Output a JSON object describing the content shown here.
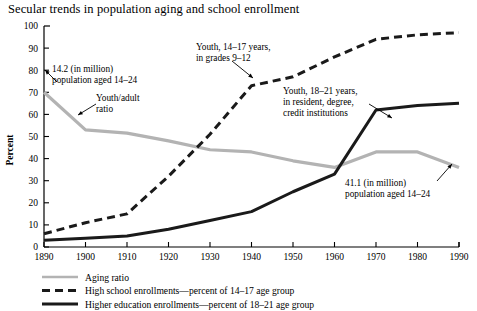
{
  "chart_data": {
    "type": "line",
    "title": "Secular trends in population aging and school enrollment",
    "xlabel": "",
    "ylabel": "Percent",
    "xlim": [
      1890,
      1990
    ],
    "ylim": [
      0,
      100
    ],
    "grid": false,
    "legend_position": "below-plot-left",
    "x": [
      1890,
      1900,
      1910,
      1920,
      1930,
      1940,
      1950,
      1960,
      1970,
      1980,
      1990
    ],
    "xticklabels": [
      "1890",
      "1900",
      "1910",
      "1920",
      "1930",
      "1940",
      "1950",
      "1960",
      "1970",
      "1980",
      "1990"
    ],
    "yticklabels": [
      "0",
      "10",
      "20",
      "30",
      "40",
      "50",
      "60",
      "70",
      "80",
      "90",
      "100"
    ],
    "yticks": [
      0,
      10,
      20,
      30,
      40,
      50,
      60,
      70,
      80,
      90,
      100
    ],
    "series": [
      {
        "name": "Aging ratio",
        "key": "aging_ratio",
        "style": "solid",
        "color": "#b3b3b3",
        "width": 3.2,
        "values": [
          70,
          53,
          51.5,
          48,
          44,
          43,
          39,
          36,
          43,
          43,
          36
        ]
      },
      {
        "name": "High school enrollments—percent of 14–17 age group",
        "key": "high_school",
        "style": "dashed",
        "color": "#1a1a1a",
        "width": 3.0,
        "values": [
          6,
          11,
          15,
          32,
          51,
          73,
          77,
          86,
          94,
          96,
          97
        ]
      },
      {
        "name": "Higher education enrollments—percent of 18–21 age group",
        "key": "higher_education",
        "style": "solid",
        "color": "#1a1a1a",
        "width": 3.0,
        "values": [
          3,
          4,
          5,
          8,
          12,
          16,
          25,
          33,
          62,
          64,
          65
        ]
      }
    ],
    "annotations": [
      {
        "id": "aging-start",
        "lines": [
          "14.2 (in million)",
          "population aged 14–24"
        ],
        "target_year": 1890,
        "target_value": 70
      },
      {
        "id": "youth-adult-ratio",
        "lines": [
          "Youth/adult",
          "ratio"
        ],
        "target_year": 1905,
        "target_value": 52
      },
      {
        "id": "high-school-label",
        "lines": [
          "Youth, 14–17 years,",
          "in grades 9–12"
        ],
        "target_year": 1938,
        "target_value": 70
      },
      {
        "id": "higher-education-label",
        "lines": [
          "Youth, 18–21 years,",
          "in resident, degree,",
          "credit institutions"
        ],
        "target_year": 1968,
        "target_value": 58
      },
      {
        "id": "aging-end",
        "lines": [
          "41.1 (in million)",
          "population aged 14–24"
        ],
        "target_year": 1988,
        "target_value": 38
      }
    ]
  },
  "legend": {
    "items": [
      {
        "label": "Aging ratio",
        "style": "solid",
        "color": "#b3b3b3"
      },
      {
        "label": "High school enrollments—percent of 14–17 age group",
        "style": "dashed",
        "color": "#1a1a1a"
      },
      {
        "label": "Higher education enrollments—percent of 18–21 age group",
        "style": "solid",
        "color": "#1a1a1a"
      }
    ]
  }
}
